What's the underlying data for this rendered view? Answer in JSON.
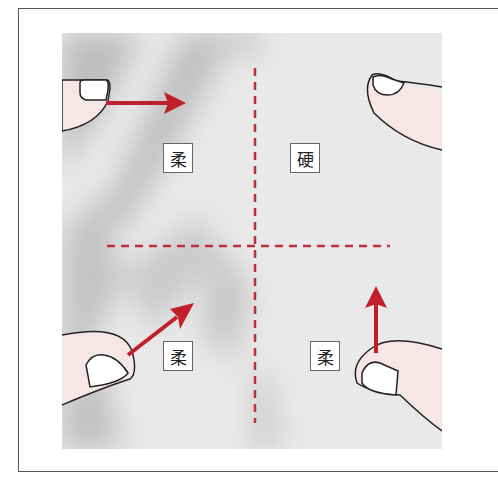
{
  "figure": {
    "quadrants": [
      {
        "position": "top-left",
        "label": "柔",
        "gesture": "thumb swipe right"
      },
      {
        "position": "top-right",
        "label": "硬",
        "gesture": "thumb rest (no arrow)"
      },
      {
        "position": "bottom-left",
        "label": "柔",
        "gesture": "thumb swipe up-right"
      },
      {
        "position": "bottom-right",
        "label": "柔",
        "gesture": "thumb swipe up"
      }
    ],
    "colors": {
      "arrow": "#c0202a",
      "divider": "#c0303a",
      "background": "#e9e9e9",
      "skin": "#f6e6e6",
      "outline": "#222222"
    }
  }
}
